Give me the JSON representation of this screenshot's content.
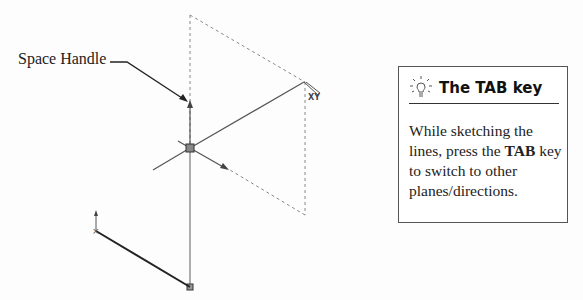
{
  "callout": {
    "label": "Space Handle"
  },
  "tip": {
    "icon": "lightbulb-icon",
    "title": "The TAB key",
    "body_parts": [
      "While sketching the lines, press the ",
      "TAB",
      " key to switch to other planes/directions."
    ]
  },
  "sketch": {
    "cursor_label": "XY",
    "colors": {
      "line": "#444444",
      "dashed": "#888888",
      "solid_thick": "#222222"
    }
  }
}
